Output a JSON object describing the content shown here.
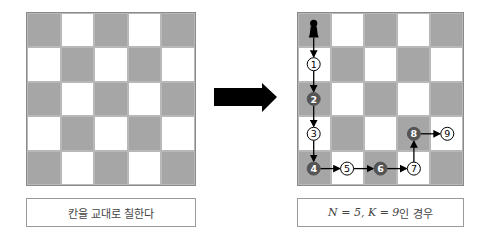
{
  "colors": {
    "dark_cell": "#a6a6a6",
    "light_cell": "#ffffff",
    "arrow": "#000000",
    "filled_node": "#555555"
  },
  "left_board": {
    "size": 5,
    "caption": "칸을 교대로 칠한다"
  },
  "transform_arrow": {
    "icon": "right-arrow-icon"
  },
  "right_board": {
    "size": 5,
    "caption_math": "N = 5, K = 9",
    "caption_suffix": "인 경우",
    "start_piece": "pawn-icon",
    "path": [
      {
        "label": "1",
        "row": 1,
        "col": 0,
        "filled": false
      },
      {
        "label": "2",
        "row": 2,
        "col": 0,
        "filled": true
      },
      {
        "label": "3",
        "row": 3,
        "col": 0,
        "filled": false
      },
      {
        "label": "4",
        "row": 4,
        "col": 0,
        "filled": true
      },
      {
        "label": "5",
        "row": 4,
        "col": 1,
        "filled": false
      },
      {
        "label": "6",
        "row": 4,
        "col": 2,
        "filled": true
      },
      {
        "label": "7",
        "row": 4,
        "col": 3,
        "filled": false
      },
      {
        "label": "8",
        "row": 3,
        "col": 3,
        "filled": true
      },
      {
        "label": "9",
        "row": 3,
        "col": 4,
        "filled": false
      }
    ]
  }
}
